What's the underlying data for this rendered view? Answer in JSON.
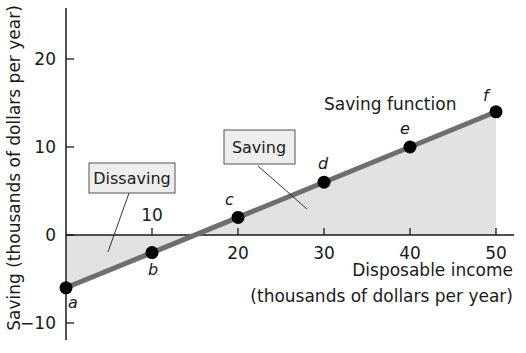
{
  "chart_data": {
    "type": "line",
    "title": "",
    "xlabel_line1": "Disposable income",
    "xlabel_line2": "(thousands of dollars per year)",
    "ylabel": "Saving (thousands of dollars per year)",
    "xlim": [
      0,
      52
    ],
    "ylim": [
      -10,
      25
    ],
    "x_ticks": [
      10,
      20,
      30,
      40,
      50
    ],
    "y_ticks": [
      -10,
      0,
      10,
      20
    ],
    "grid": false,
    "series": [
      {
        "name": "Saving function",
        "points": [
          {
            "label": "a",
            "x": 0,
            "y": -6
          },
          {
            "label": "b",
            "x": 10,
            "y": -2
          },
          {
            "label": "c",
            "x": 20,
            "y": 2
          },
          {
            "label": "d",
            "x": 30,
            "y": 6
          },
          {
            "label": "e",
            "x": 40,
            "y": 10
          },
          {
            "label": "f",
            "x": 50,
            "y": 14
          }
        ]
      }
    ],
    "annotations": {
      "series_label": "Saving function",
      "dissaving_box": "Dissaving",
      "saving_box": "Saving"
    },
    "colors": {
      "line": "#6e6e6e",
      "point": "#000000",
      "shade": "#e2e2e2",
      "box_fill": "#eeeeee",
      "axis": "#1a1a1a"
    }
  }
}
